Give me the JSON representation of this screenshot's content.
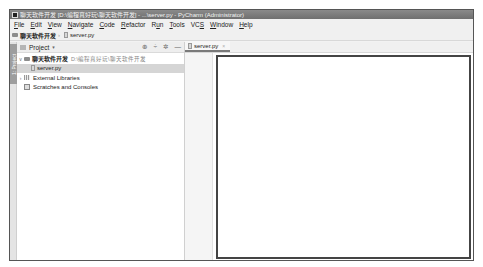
{
  "window": {
    "title": "聊天软件开发 [D:\\编程真好玩\\聊天软件开发] - ...\\server.py - PyCharm (Administrator)"
  },
  "menubar": {
    "items": [
      {
        "label": "File",
        "mnemonic": "F"
      },
      {
        "label": "Edit",
        "mnemonic": "E"
      },
      {
        "label": "View",
        "mnemonic": "V"
      },
      {
        "label": "Navigate",
        "mnemonic": "N"
      },
      {
        "label": "Code",
        "mnemonic": "C"
      },
      {
        "label": "Refactor",
        "mnemonic": "R"
      },
      {
        "label": "Run",
        "mnemonic": "u"
      },
      {
        "label": "Tools",
        "mnemonic": "T"
      },
      {
        "label": "VCS",
        "mnemonic": "S"
      },
      {
        "label": "Window",
        "mnemonic": "W"
      },
      {
        "label": "Help",
        "mnemonic": "H"
      }
    ]
  },
  "navbar": {
    "project": "聊天软件开发",
    "file": "server.py"
  },
  "tool_strip": {
    "project_tab": "1: Project"
  },
  "project_panel": {
    "title": "Project",
    "dropdown_icon": "▾",
    "tools": {
      "locate": "⊕",
      "collapse": "÷",
      "settings": "✲",
      "hide": "—"
    },
    "tree": {
      "root": {
        "name": "聊天软件开发",
        "path": "D:\\编程真好玩\\聊天软件开发",
        "arrow": "∨"
      },
      "file": {
        "name": "server.py"
      },
      "libraries": {
        "name": "External Libraries",
        "arrow": "›"
      },
      "scratches": {
        "name": "Scratches and Consoles"
      }
    }
  },
  "editor": {
    "tabs": [
      {
        "label": "server.py",
        "close": "×"
      }
    ]
  }
}
